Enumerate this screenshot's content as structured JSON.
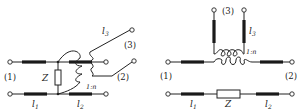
{
  "diagrams": [
    {
      "id": "left",
      "description": "Shunt impedance Z between lines l1 and l2 with transformer 1:n coupling to line l3",
      "labels": {
        "port1": "(1)",
        "port2": "(2)",
        "port3": "(3)",
        "impedance": "Z",
        "line1": "l",
        "line1_sub": "1",
        "line2": "l",
        "line2_sub": "2",
        "line3": "l",
        "line3_sub": "3",
        "ratio": "1:n"
      }
    },
    {
      "id": "right",
      "description": "Series impedance Z in lower conductor, transformer 1:n in upper conductor coupling to line l3",
      "labels": {
        "port1": "(1)",
        "port2": "(2)",
        "port3": "(3)",
        "impedance": "Z",
        "line1": "l",
        "line1_sub": "1",
        "line2": "l",
        "line2_sub": "2",
        "line3": "l",
        "line3_sub": "3",
        "ratio": "1:n"
      }
    }
  ],
  "colors": {
    "stroke": "#222222",
    "line_fill": "#1a1a1a",
    "background": "#ffffff"
  }
}
